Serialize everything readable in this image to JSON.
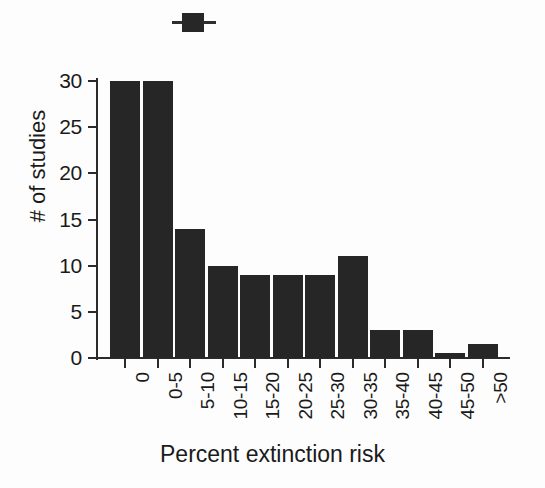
{
  "figure": {
    "background_color": "#fdfdfd",
    "bar_color": "#262626",
    "axis_color": "#2b2b2b",
    "text_color": "#1a1a1a",
    "marker_label": "top-square-marker"
  },
  "chart_data": {
    "type": "bar",
    "title": "",
    "xlabel": "Percent extinction risk",
    "ylabel": "# of studies",
    "categories": [
      "0",
      "0-5",
      "5-10",
      "10-15",
      "15-20",
      "20-25",
      "25-30",
      "30-35",
      "35-40",
      "40-45",
      "45-50",
      ">50"
    ],
    "values": [
      30,
      30,
      14,
      10,
      9,
      9,
      9,
      11,
      3,
      3,
      0.5,
      1.5
    ],
    "ylim": [
      0,
      31
    ],
    "yticks": [
      0,
      5,
      10,
      15,
      20,
      25,
      30
    ],
    "ytick_labels": [
      "0",
      "5",
      "10",
      "15",
      "20",
      "25",
      "30"
    ],
    "grid": false,
    "legend": "none",
    "xtick_rotation": -90,
    "bar_color": "#262626"
  }
}
